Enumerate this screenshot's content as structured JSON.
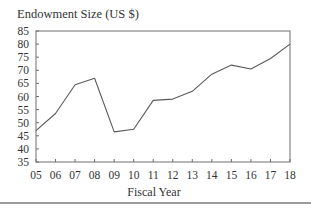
{
  "chart_data": {
    "type": "line",
    "title": "Endowment Size (US $)",
    "xlabel": "Fiscal Year",
    "ylabel": "Endowment Size (US $)",
    "categories": [
      "05",
      "06",
      "07",
      "08",
      "09",
      "10",
      "11",
      "12",
      "13",
      "14",
      "15",
      "16",
      "17",
      "18"
    ],
    "series": [
      {
        "name": "Endowment Size",
        "values": [
          47,
          53.5,
          64.5,
          67,
          46.5,
          47.5,
          58.5,
          59,
          62,
          68.5,
          72,
          70.5,
          74.5,
          80
        ]
      }
    ],
    "ylim": [
      35,
      85
    ],
    "yticks": [
      35,
      40,
      45,
      50,
      55,
      60,
      65,
      70,
      75,
      80,
      85
    ],
    "grid": false,
    "legend": null
  },
  "colors": {
    "line": "#5a5a5a",
    "frame": "#6e6e6e",
    "text": "#333333",
    "separator": "#9a9a9a",
    "background": "#ffffff"
  }
}
